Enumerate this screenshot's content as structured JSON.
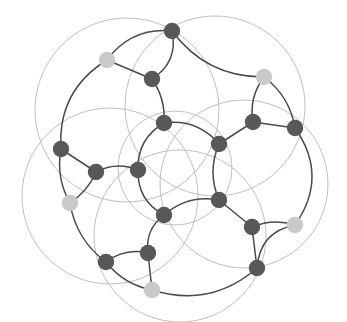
{
  "figure": {
    "width": 347,
    "height": 322,
    "background_color": "#ffffff"
  },
  "style": {
    "face_circle_stroke": "#b8b8b8",
    "face_circle_stroke_width": 0.9,
    "edge_stroke": "#4a4a4a",
    "edge_stroke_width": 1.5,
    "node_radius": 8.2,
    "node_dark_color": "#585858",
    "node_light_color": "#c9c9c9",
    "node_darkest_color": "#4e4e4e"
  },
  "chart_data": {
    "type": "diagram",
    "subtype": "node-link-graph",
    "node_count": 20,
    "edge_count": 30,
    "face_circle_count": 6,
    "color_classes": [
      {
        "name": "dark",
        "hex": "#585858",
        "count": 14
      },
      {
        "name": "light",
        "hex": "#c9c9c9",
        "count": 6
      }
    ],
    "face_circles": [
      {
        "id": "f-center",
        "cx": 175,
        "cy": 168,
        "r": 57
      },
      {
        "id": "f-top-left",
        "cx": 127,
        "cy": 110,
        "r": 92
      },
      {
        "id": "f-top-right",
        "cx": 215,
        "cy": 106,
        "r": 90
      },
      {
        "id": "f-right",
        "cx": 244,
        "cy": 184,
        "r": 84
      },
      {
        "id": "f-bottom",
        "cx": 180,
        "cy": 236,
        "r": 86
      },
      {
        "id": "f-left",
        "cx": 110,
        "cy": 196,
        "r": 88
      }
    ],
    "nodes": [
      {
        "id": "n1",
        "x": 172,
        "y": 31,
        "shade": "dark"
      },
      {
        "id": "n2",
        "x": 107,
        "y": 60,
        "shade": "light"
      },
      {
        "id": "n3",
        "x": 152,
        "y": 79,
        "shade": "dark"
      },
      {
        "id": "n4",
        "x": 264,
        "y": 77,
        "shade": "light"
      },
      {
        "id": "n5",
        "x": 164,
        "y": 123,
        "shade": "dark"
      },
      {
        "id": "n6",
        "x": 253,
        "y": 122,
        "shade": "dark"
      },
      {
        "id": "n7",
        "x": 295,
        "y": 128,
        "shade": "dark"
      },
      {
        "id": "n8",
        "x": 219,
        "y": 144,
        "shade": "dark"
      },
      {
        "id": "n9",
        "x": 61,
        "y": 149,
        "shade": "dark"
      },
      {
        "id": "n10",
        "x": 96,
        "y": 172,
        "shade": "dark"
      },
      {
        "id": "n11",
        "x": 138,
        "y": 170,
        "shade": "dark"
      },
      {
        "id": "n12",
        "x": 70,
        "y": 203,
        "shade": "light"
      },
      {
        "id": "n13",
        "x": 219,
        "y": 200,
        "shade": "dark"
      },
      {
        "id": "n14",
        "x": 164,
        "y": 215,
        "shade": "dark"
      },
      {
        "id": "n15",
        "x": 252,
        "y": 227,
        "shade": "dark"
      },
      {
        "id": "n16",
        "x": 295,
        "y": 225,
        "shade": "light"
      },
      {
        "id": "n17",
        "x": 106,
        "y": 262,
        "shade": "dark"
      },
      {
        "id": "n18",
        "x": 148,
        "y": 253,
        "shade": "dark"
      },
      {
        "id": "n19",
        "x": 152,
        "y": 290,
        "shade": "light"
      },
      {
        "id": "n20",
        "x": 257,
        "y": 268,
        "shade": "dark"
      }
    ],
    "edges": [
      {
        "source": "n1",
        "target": "n3"
      },
      {
        "source": "n1",
        "target": "n4"
      },
      {
        "source": "n1",
        "target": "n2"
      },
      {
        "source": "n2",
        "target": "n3"
      },
      {
        "source": "n2",
        "target": "n9"
      },
      {
        "source": "n3",
        "target": "n5"
      },
      {
        "source": "n4",
        "target": "n6"
      },
      {
        "source": "n4",
        "target": "n7"
      },
      {
        "source": "n5",
        "target": "n8"
      },
      {
        "source": "n5",
        "target": "n11"
      },
      {
        "source": "n6",
        "target": "n7"
      },
      {
        "source": "n6",
        "target": "n8"
      },
      {
        "source": "n7",
        "target": "n16"
      },
      {
        "source": "n8",
        "target": "n13"
      },
      {
        "source": "n9",
        "target": "n10"
      },
      {
        "source": "n9",
        "target": "n12"
      },
      {
        "source": "n10",
        "target": "n11"
      },
      {
        "source": "n10",
        "target": "n12"
      },
      {
        "source": "n11",
        "target": "n14"
      },
      {
        "source": "n12",
        "target": "n17"
      },
      {
        "source": "n13",
        "target": "n14"
      },
      {
        "source": "n13",
        "target": "n15"
      },
      {
        "source": "n14",
        "target": "n18"
      },
      {
        "source": "n15",
        "target": "n16"
      },
      {
        "source": "n15",
        "target": "n20"
      },
      {
        "source": "n16",
        "target": "n20"
      },
      {
        "source": "n17",
        "target": "n18"
      },
      {
        "source": "n17",
        "target": "n19"
      },
      {
        "source": "n18",
        "target": "n19"
      },
      {
        "source": "n19",
        "target": "n20"
      }
    ],
    "edge_curvature": {
      "n1-n3": -18,
      "n1-n4": 26,
      "n1-n2": 20,
      "n2-n3": 0,
      "n2-n9": 30,
      "n3-n5": -8,
      "n4-n6": 10,
      "n4-n7": -12,
      "n5-n8": -16,
      "n5-n11": 16,
      "n6-n7": 0,
      "n6-n8": 0,
      "n7-n16": -34,
      "n8-n13": 12,
      "n9-n10": 0,
      "n9-n12": 10,
      "n10-n11": -10,
      "n10-n12": -6,
      "n11-n14": 16,
      "n12-n17": 14,
      "n13-n14": 14,
      "n13-n15": 0,
      "n14-n18": 12,
      "n15-n16": -8,
      "n15-n20": 0,
      "n16-n20": 22,
      "n17-n18": -10,
      "n17-n19": 10,
      "n18-n19": 0,
      "n19-n20": 30
    }
  }
}
